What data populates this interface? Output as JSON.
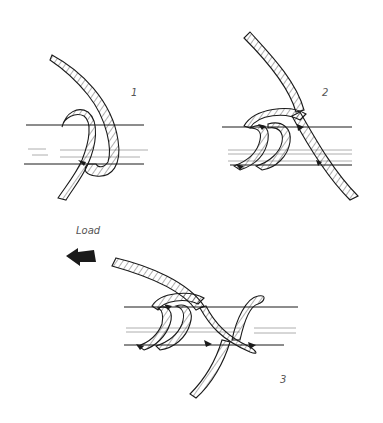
{
  "figure": {
    "colors": {
      "ink": "#1a1a1a",
      "label": "#555555",
      "background": "#ffffff",
      "pole_shade": "#9a9a9a"
    },
    "steps": [
      {
        "number": "1",
        "label": "1"
      },
      {
        "number": "2",
        "label": "2"
      },
      {
        "number": "3",
        "label": "3"
      }
    ],
    "load": {
      "label": "Load",
      "arrow_direction": "left",
      "icon": "arrow-left-icon"
    }
  }
}
